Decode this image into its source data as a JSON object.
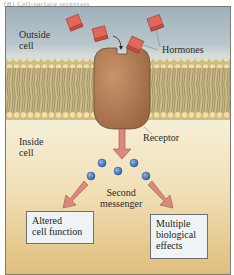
{
  "caption": "(B) Cell-surface receptors",
  "labels": {
    "outside_cell": [
      "Outside",
      "cell"
    ],
    "inside_cell": [
      "Inside",
      "cell"
    ],
    "hormones": "Hormones",
    "receptor": "Receptor",
    "second_messenger": [
      "Second",
      "messenger"
    ]
  },
  "outcomes": [
    {
      "lines": [
        "Altered",
        "cell function"
      ]
    },
    {
      "lines": [
        "Multiple",
        "biological",
        "effects"
      ]
    }
  ],
  "colors": {
    "hormone": "#e0675a",
    "receptor": "#b07a52",
    "arrow": "#d98a7c",
    "messenger": "#3f74c0",
    "lipid_head": "#f1dfa3",
    "lipid_tail": "#a99468"
  }
}
